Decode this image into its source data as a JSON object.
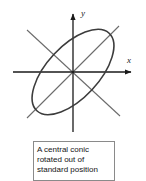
{
  "figure": {
    "name": "central-conic-rotated",
    "canvas": {
      "width": 146,
      "height": 181,
      "background": "#ffffff"
    },
    "colors": {
      "axis": "#1a1a1a",
      "rotated_axis": "#6b6b6b",
      "conic_curve": "#3c3c3c",
      "caption_border": "#8a8a8a",
      "caption_text": "#141414",
      "page_background": "#ffffff"
    },
    "axes": {
      "origin": {
        "x": 73,
        "y": 72
      },
      "x_axis": {
        "label": "x",
        "label_position": {
          "x": 127,
          "y": 60
        },
        "start": {
          "x": 13,
          "y": 72
        },
        "end": {
          "x": 137,
          "y": 72
        },
        "arrow": "right"
      },
      "y_axis": {
        "label": "y",
        "label_position": {
          "x": 81,
          "y": 13
        },
        "start": {
          "x": 73,
          "y": 132
        },
        "end": {
          "x": 73,
          "y": 8
        },
        "arrow": "up"
      }
    },
    "rotated_axes": [
      {
        "name": "major-axis-line",
        "from": {
          "x": 27,
          "y": 118
        },
        "to": {
          "x": 119,
          "y": 26
        },
        "angle_deg": 45
      },
      {
        "name": "minor-axis-line",
        "from": {
          "x": 27,
          "y": 30
        },
        "to": {
          "x": 120,
          "y": 116
        },
        "angle_deg": -43
      }
    ],
    "conic": {
      "type": "ellipse",
      "center": {
        "x": 73,
        "y": 72
      },
      "semi_major": 53,
      "semi_minor": 26,
      "rotation_deg": -47,
      "stroke_width": 1.6
    }
  },
  "caption": {
    "lines": [
      "A central conic",
      "rotated out of",
      "standard position"
    ],
    "full_text": "A central conic rotated out of standard position"
  }
}
